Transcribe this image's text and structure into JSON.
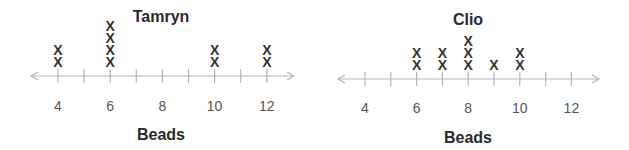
{
  "chart_data": [
    {
      "type": "dot_plot",
      "title": "Tamryn",
      "xlabel": "Beads",
      "ylabel": "",
      "marker": "X",
      "xlim": [
        3,
        13
      ],
      "ticks": [
        4,
        5,
        6,
        7,
        8,
        9,
        10,
        11,
        12
      ],
      "tick_labels": [
        "4",
        "6",
        "8",
        "10",
        "12"
      ],
      "label_values": [
        4,
        6,
        8,
        10,
        12
      ],
      "x": [
        4,
        5,
        6,
        7,
        8,
        9,
        10,
        11,
        12
      ],
      "counts": [
        2,
        0,
        4,
        0,
        0,
        0,
        2,
        0,
        2
      ],
      "grid": false
    },
    {
      "type": "dot_plot",
      "title": "Clio",
      "xlabel": "Beads",
      "ylabel": "",
      "marker": "X",
      "xlim": [
        3,
        13
      ],
      "ticks": [
        4,
        5,
        6,
        7,
        8,
        9,
        10,
        11,
        12
      ],
      "tick_labels": [
        "4",
        "6",
        "8",
        "10",
        "12"
      ],
      "label_values": [
        4,
        6,
        8,
        10,
        12
      ],
      "x": [
        4,
        5,
        6,
        7,
        8,
        9,
        10,
        11,
        12
      ],
      "counts": [
        0,
        0,
        2,
        2,
        3,
        1,
        2,
        0,
        0
      ],
      "grid": false
    }
  ],
  "layout": {
    "plots": [
      {
        "offset_x": 0,
        "axis_y": 76,
        "axis_x0": 31,
        "axis_x1": 294,
        "x4": 58,
        "step": 26.1,
        "title_x": 161,
        "title_y": 17,
        "label_y": 106,
        "xlabel_x": 161,
        "xlabel_y": 135,
        "mark_base_y": 62,
        "mark_step": 12
      },
      {
        "offset_x": 0,
        "axis_y": 79,
        "axis_x0": 338,
        "axis_x1": 599,
        "x4": 365,
        "step": 25.8,
        "title_x": 468,
        "title_y": 20,
        "label_y": 108,
        "xlabel_x": 468,
        "xlabel_y": 138,
        "mark_base_y": 65,
        "mark_step": 12
      }
    ],
    "axis_color": "#b5b5b5",
    "mark_color": "#333333"
  }
}
